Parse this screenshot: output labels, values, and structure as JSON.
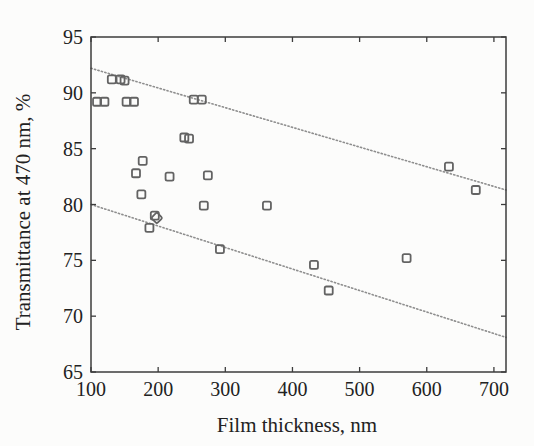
{
  "figure": {
    "background": "#fcfcfb",
    "axis_color": "#3c3c3c",
    "text_color": "#222222",
    "marker_color": "#636363",
    "trend_line_color": "#8e8e8e"
  },
  "chart_data": {
    "type": "scatter",
    "title": "",
    "xlabel": "Film thickness, nm",
    "ylabel": "Transmittance at 470 nm, %",
    "xlim": [
      100,
      718
    ],
    "ylim": [
      65,
      95
    ],
    "xticks": [
      100,
      200,
      300,
      400,
      500,
      600,
      700
    ],
    "yticks": [
      65,
      70,
      75,
      80,
      85,
      90,
      95
    ],
    "grid": false,
    "legend": null,
    "marker": "open-square",
    "points": [
      {
        "x": 131,
        "y": 91.2
      },
      {
        "x": 144,
        "y": 91.2
      },
      {
        "x": 150,
        "y": 91.1
      },
      {
        "x": 109,
        "y": 89.2
      },
      {
        "x": 120,
        "y": 89.2
      },
      {
        "x": 153,
        "y": 89.2
      },
      {
        "x": 164,
        "y": 89.2
      },
      {
        "x": 253,
        "y": 89.4
      },
      {
        "x": 265,
        "y": 89.4
      },
      {
        "x": 239,
        "y": 86.0
      },
      {
        "x": 246,
        "y": 85.9
      },
      {
        "x": 177,
        "y": 83.9
      },
      {
        "x": 167,
        "y": 82.8
      },
      {
        "x": 217,
        "y": 82.5
      },
      {
        "x": 274,
        "y": 82.6
      },
      {
        "x": 175,
        "y": 80.9
      },
      {
        "x": 268,
        "y": 79.9
      },
      {
        "x": 362,
        "y": 79.9
      },
      {
        "x": 195,
        "y": 79.0
      },
      {
        "x": 198,
        "y": 78.8,
        "shape": "diamond"
      },
      {
        "x": 187,
        "y": 77.9
      },
      {
        "x": 292,
        "y": 76.0
      },
      {
        "x": 432,
        "y": 74.6
      },
      {
        "x": 454,
        "y": 72.3
      },
      {
        "x": 570,
        "y": 75.2
      },
      {
        "x": 633,
        "y": 83.4
      },
      {
        "x": 673,
        "y": 81.3
      }
    ],
    "trend_lines": [
      {
        "name": "upper-bound",
        "x1": 100,
        "y1": 92.2,
        "x2": 718,
        "y2": 81.3,
        "style": "dotted"
      },
      {
        "name": "lower-bound",
        "x1": 100,
        "y1": 80.0,
        "x2": 718,
        "y2": 68.1,
        "style": "dotted"
      }
    ]
  }
}
